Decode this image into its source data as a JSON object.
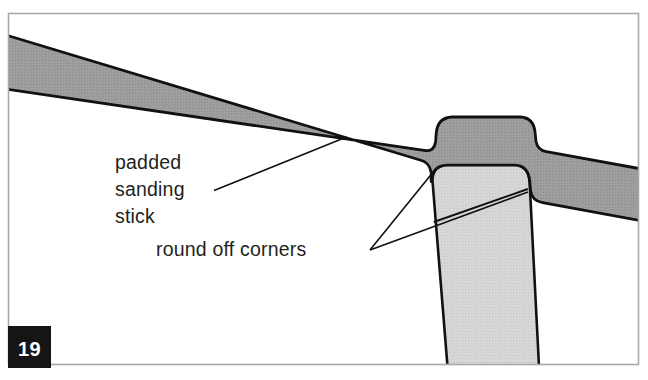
{
  "figure": {
    "number_badge": "19",
    "caption_labels": [
      {
        "id": "padded-sanding-stick",
        "lines": [
          "padded",
          "sanding",
          "stick"
        ],
        "line1": "padded",
        "line2": "sanding",
        "line3": "stick"
      },
      {
        "id": "round-off-corners",
        "text": "round off corners"
      }
    ],
    "parts": [
      {
        "name": "padded sanding stick",
        "shade": "#9c9c9c"
      },
      {
        "name": "workpiece post",
        "shade": "#d5d5d5"
      }
    ],
    "colors": {
      "background": "#ffffff",
      "frame_border": "#a9a9a9",
      "outline": "#111111",
      "stick_fill": "#9c9c9c",
      "post_fill": "#d5d5d5",
      "badge_background": "#151515",
      "badge_text": "#ffffff",
      "label_text": "#231f20"
    }
  }
}
